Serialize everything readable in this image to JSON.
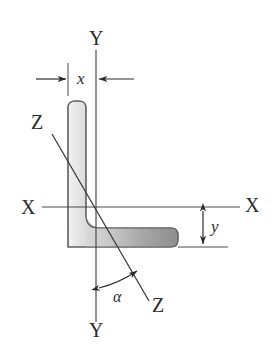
{
  "figure": {
    "type": "engineering-cross-section-diagram",
    "background_color": "#ffffff",
    "line_color": "#2b2b2b",
    "section_fill_light": "#e8e8e8",
    "section_fill_dark": "#8d8d8d",
    "section_outline": "#6e6e6e"
  },
  "labels": {
    "y_axis_top": "Y",
    "y_axis_bottom": "Y",
    "x_axis_left": "X",
    "x_axis_right": "X",
    "z_axis_upper": "Z",
    "z_axis_lower": "Z",
    "x_dimension": "x",
    "y_dimension": "y",
    "angle": "α"
  },
  "axes": [
    {
      "name": "X-X",
      "orientation": "horizontal",
      "label_start": "X",
      "label_end": "X",
      "x1": 42,
      "y1": 207,
      "x2": 240,
      "y2": 207
    },
    {
      "name": "Y-Y",
      "orientation": "vertical",
      "label_start": "Y",
      "label_end": "Y",
      "x1": 96,
      "y1": 50,
      "x2": 96,
      "y2": 322
    },
    {
      "name": "Z-Z",
      "orientation": "inclined",
      "label_start": "Z",
      "label_end": "Z",
      "x1": 52,
      "y1": 134,
      "x2": 149,
      "y2": 301
    }
  ],
  "dimensions": [
    {
      "name": "x",
      "label": "x",
      "description": "horizontal centroid distance from outer face of vertical leg to Y-Y axis",
      "style": "inward-arrows-between-extension-lines"
    },
    {
      "name": "y",
      "label": "y",
      "description": "vertical centroid distance from bottom of horizontal flange to X-X axis",
      "style": "double-headed-vertical-arrow"
    }
  ],
  "angle_annotation": {
    "label": "α",
    "description": "angle measured from Y-Y axis to Z-Z axis",
    "arc_style": "double-headed-arc"
  }
}
